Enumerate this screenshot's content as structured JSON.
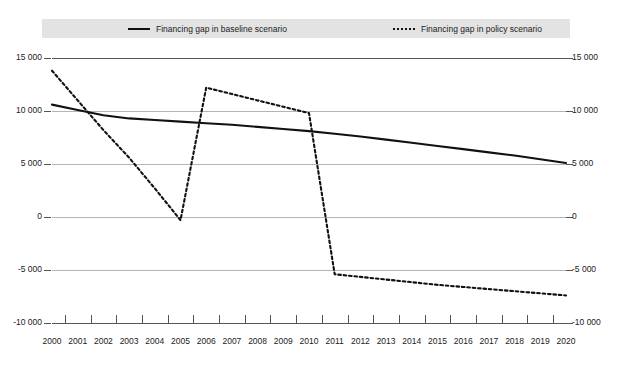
{
  "legend": {
    "baseline_label": "Financing gap in baseline scenario",
    "policy_label": "Financing gap in policy scenario",
    "baseline_key": "solid-line-icon",
    "policy_key": "dotted-line-icon",
    "band_color": "#e3e3e3"
  },
  "chart_data": {
    "type": "line",
    "title": "",
    "xlabel": "",
    "ylabel": "",
    "ylim": [
      -10000,
      15000
    ],
    "yticks": [
      15000,
      10000,
      5000,
      0,
      -5000,
      -10000
    ],
    "ytick_labels_left": [
      "15 000",
      "10 000",
      "5 000",
      "0",
      "-5 000",
      "-10 000"
    ],
    "ytick_labels_right": [
      "15 000",
      "10 000",
      "5 000",
      "0",
      "-5 000",
      "-10 000"
    ],
    "grid": true,
    "legend_position": "top",
    "categories": [
      "2000",
      "2001",
      "2002",
      "2003",
      "2004",
      "2005",
      "2006",
      "2007",
      "2008",
      "2009",
      "2010",
      "2011",
      "2012",
      "2013",
      "2014",
      "2015",
      "2016",
      "2017",
      "2018",
      "2019",
      "2020"
    ],
    "series": [
      {
        "name": "Financing gap in baseline scenario",
        "style": "solid",
        "color": "#111111",
        "values": [
          10600,
          10100,
          9600,
          9300,
          9150,
          9000,
          8850,
          8700,
          8500,
          8300,
          8100,
          7850,
          7600,
          7300,
          7000,
          6700,
          6400,
          6100,
          5800,
          5450,
          5100
        ]
      },
      {
        "name": "Financing gap in policy scenario",
        "style": "dotted",
        "color": "#111111",
        "values": [
          13800,
          11000,
          8200,
          5600,
          2700,
          -300,
          12200,
          11600,
          11000,
          10400,
          9800,
          -5400,
          -5650,
          -5900,
          -6150,
          -6400,
          -6600,
          -6800,
          -7000,
          -7200,
          -7400
        ]
      }
    ]
  },
  "axis": {
    "x_min_label": "2000",
    "x_max_label": "2020"
  }
}
